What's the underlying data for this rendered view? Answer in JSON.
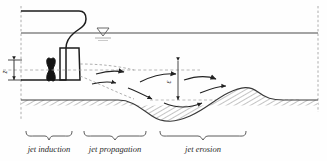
{
  "figure": {
    "title_visible": false,
    "type": "propeller-jet-scour-schematic",
    "zones": [
      {
        "key": "induction",
        "label": "jet induction",
        "brace_x1": 26,
        "brace_x2": 72,
        "label_x": 49,
        "label_y": 150
      },
      {
        "key": "propagation",
        "label": "jet propagation",
        "brace_x1": 84,
        "brace_x2": 146,
        "label_x": 115,
        "label_y": 150
      },
      {
        "key": "erosion",
        "label": "jet erosion",
        "brace_x1": 160,
        "brace_x2": 246,
        "label_x": 203,
        "label_y": 150
      }
    ],
    "dimensions": [
      {
        "key": "propeller_axis_height",
        "label": "z",
        "x": 10,
        "y_top": 60,
        "y_bottom": 80,
        "orientation": "vertical",
        "text_x": 7,
        "text_y": 71
      },
      {
        "key": "scour_depth",
        "label": "ε",
        "x": 175,
        "y_top": 61,
        "y_bottom": 100,
        "orientation": "vertical",
        "text_x": 171,
        "text_y": 82
      }
    ],
    "elements": {
      "water_surface_label": "water-level-symbol",
      "hull_label": "ship-hull-stern",
      "propeller_label": "propeller",
      "rudder_label": "rudder",
      "bed_label": "sediment-bed",
      "scour_hole_label": "scour-hole",
      "mound_label": "deposition-mound"
    },
    "colors": {
      "line": "#1d1d1d",
      "water_surface": "#4a4a4a",
      "dashed": "#8d8d8d",
      "bed_fill": "#b9b9b9",
      "arrow": "#222222",
      "text": "#2a2a2a"
    },
    "geometry": {
      "water_surface_y": 33,
      "bed_level_y": 100,
      "left_boundary_x": 21,
      "right_boundary_x": 318,
      "bed_profile": "M21,100 L118,100 C132,100 140,108 152,116 C164,124 176,122 190,116 C206,109 214,100 228,93 C242,86 250,86 258,92 C266,98 272,100 283,100 L318,100",
      "bed_flat_right_start_x": 283
    }
  }
}
